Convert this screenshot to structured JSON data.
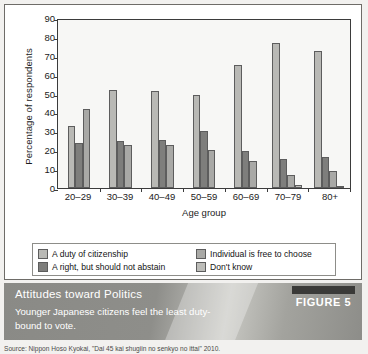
{
  "figure": {
    "caption_title": "Attitudes toward Politics",
    "caption_subtitle": "Younger Japanese citizens feel the least duty-bound to vote.",
    "badge_label": "FIGURE 5",
    "source": "Source: Nippon Hoso Kyokai, \"Dai 45 kai shugiin no senkyo no ittai\" 2010."
  },
  "chart_data": {
    "type": "bar",
    "title": "",
    "xlabel": "Age group",
    "ylabel": "Percentage of respondents",
    "categories": [
      "20–29",
      "30–39",
      "40–49",
      "50–59",
      "60–69",
      "70–79",
      "80+"
    ],
    "yticks": [
      0,
      10,
      20,
      30,
      40,
      50,
      60,
      70,
      80,
      90
    ],
    "ylim": [
      0,
      90
    ],
    "grid": false,
    "legend_position": "bottom",
    "series": [
      {
        "name": "A duty of citizenship",
        "color": "#b9b9b5",
        "values": [
          33,
          52,
          51.5,
          49.5,
          65,
          77,
          72.5
        ]
      },
      {
        "name": "A right, but should not abstain",
        "color": "#7e7e7c",
        "values": [
          24,
          25,
          25.5,
          30,
          19.5,
          15.5,
          16.5
        ]
      },
      {
        "name": "Individual is free to choose",
        "color": "#a9a9a6",
        "values": [
          42,
          23,
          23,
          20,
          14.5,
          7,
          9
        ]
      },
      {
        "name": "Don't know",
        "color": "#bdbdb9",
        "values": [
          0,
          0,
          0,
          0,
          0,
          1.5,
          1
        ]
      }
    ]
  }
}
